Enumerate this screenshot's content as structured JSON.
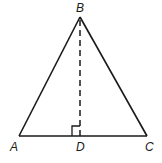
{
  "diagram": {
    "type": "geometry-triangle",
    "points": {
      "A": {
        "label": "A",
        "x": 19,
        "y": 136
      },
      "B": {
        "label": "B",
        "x": 80,
        "y": 17
      },
      "C": {
        "label": "C",
        "x": 147,
        "y": 136
      },
      "D": {
        "label": "D",
        "x": 80,
        "y": 136
      }
    },
    "segments": [
      {
        "from": "A",
        "to": "B",
        "style": "solid"
      },
      {
        "from": "B",
        "to": "C",
        "style": "solid"
      },
      {
        "from": "A",
        "to": "C",
        "style": "solid"
      },
      {
        "from": "B",
        "to": "D",
        "style": "dashed"
      }
    ],
    "right_angle_marker": {
      "at": "D",
      "between": [
        "B",
        "A"
      ]
    },
    "stroke_color": "#1a1a1a",
    "background": "#ffffff"
  }
}
